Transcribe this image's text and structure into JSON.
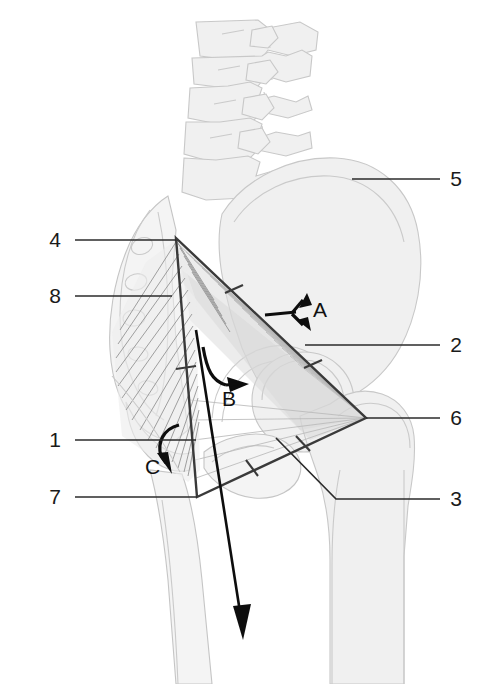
{
  "figure": {
    "width": 488,
    "height": 684,
    "background": "#ffffff"
  },
  "colors": {
    "bone_fill": "#f0f0f0",
    "bone_outline": "#c8c8c8",
    "triangle_edge": "#3a3a3a",
    "arrow": "#0d0d0d",
    "leader_line": "#2b2b2b",
    "label_text": "#1a1a1a",
    "muscle_fiber": "#b9b9b9"
  },
  "numeric_labels": [
    {
      "id": "label-1",
      "text": "1",
      "side": "left",
      "text_x": 55,
      "text_y": 447,
      "line_from_x": 75,
      "line_from_y": 440,
      "line_to_x": 196,
      "line_to_y": 440
    },
    {
      "id": "label-2",
      "text": "2",
      "side": "right",
      "text_x": 452,
      "text_y": 352,
      "line_from_x": 305,
      "line_from_y": 345,
      "line_to_x": 440,
      "line_to_y": 345
    },
    {
      "id": "label-3",
      "text": "3",
      "side": "right",
      "text_x": 452,
      "text_y": 506,
      "line_from_x": 336,
      "line_from_y": 499,
      "line_to_x": 440,
      "line_to_y": 499
    },
    {
      "id": "label-4",
      "text": "4",
      "side": "left",
      "text_x": 55,
      "text_y": 247,
      "line_from_x": 75,
      "line_from_y": 240,
      "line_to_x": 176,
      "line_to_y": 240
    },
    {
      "id": "label-5",
      "text": "5",
      "side": "right",
      "text_x": 452,
      "text_y": 186,
      "line_from_x": 352,
      "line_from_y": 179,
      "line_to_x": 440,
      "line_to_y": 179
    },
    {
      "id": "label-6",
      "text": "6",
      "side": "right",
      "text_x": 452,
      "text_y": 425,
      "line_from_x": 366,
      "line_from_y": 418,
      "line_to_x": 440,
      "line_to_y": 418
    },
    {
      "id": "label-7",
      "text": "7",
      "side": "left",
      "text_x": 55,
      "text_y": 504,
      "line_from_x": 75,
      "line_from_y": 497,
      "line_to_x": 197,
      "line_to_y": 497
    },
    {
      "id": "label-8",
      "text": "8",
      "side": "left",
      "text_x": 55,
      "text_y": 303,
      "line_from_x": 75,
      "line_from_y": 296,
      "line_to_x": 170,
      "line_to_y": 296
    }
  ],
  "letter_labels": [
    {
      "id": "label-A",
      "text": "A",
      "x": 313,
      "y": 317,
      "arrow": "bifurcated-double-arrow-right"
    },
    {
      "id": "label-B",
      "text": "B",
      "x": 228,
      "y": 402,
      "arrow": "curved-arrow-right"
    },
    {
      "id": "label-C",
      "text": "C",
      "x": 153,
      "y": 469,
      "arrow": "curved-arrow-down"
    }
  ],
  "triangle": {
    "name": "force-triangle",
    "vertices": [
      {
        "name": "apex-superior",
        "x": 176,
        "y": 238
      },
      {
        "name": "apex-lateral",
        "x": 366,
        "y": 418
      },
      {
        "name": "apex-inferior",
        "x": 197,
        "y": 497
      }
    ],
    "edge_ticks": [
      {
        "edge": "superior-to-lateral",
        "t": 0.3
      },
      {
        "edge": "superior-to-lateral",
        "t": 0.72
      },
      {
        "edge": "lateral-to-inferior",
        "t": 0.35
      },
      {
        "edge": "lateral-to-inferior",
        "t": 0.68
      },
      {
        "edge": "inferior-to-superior",
        "t": 0.5
      }
    ]
  },
  "force_vector": {
    "name": "body-weight-vector",
    "from_x": 196,
    "from_y": 330,
    "to_x": 246,
    "to_y": 640
  },
  "anatomy_parts": [
    {
      "name": "lumbar-vertebrae",
      "description": "stack of three lumbar vertebrae, outline only"
    },
    {
      "name": "iliac-wing",
      "description": "large ilium blade, light gray fill"
    },
    {
      "name": "sacrum",
      "description": "sacrum with foramina, left of ilium"
    },
    {
      "name": "acetabulum",
      "description": "hip socket region"
    },
    {
      "name": "femoral-head",
      "description": "femoral head ball"
    },
    {
      "name": "greater-trochanter",
      "description": "lateral femoral prominence"
    },
    {
      "name": "femoral-shaft",
      "description": "proximal femur shaft"
    },
    {
      "name": "gluteus-medius",
      "description": "fan of abductor muscle fibers inside triangle"
    },
    {
      "name": "gluteus-fibers-left",
      "description": "hatched muscle fibers on medial side"
    }
  ]
}
